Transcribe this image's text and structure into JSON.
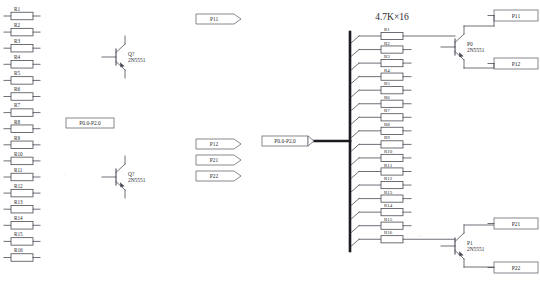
{
  "diagram": {
    "title_label": "4.7K×16",
    "colors": {
      "wire": "#4a4a55",
      "bus": "#1a1a20",
      "text": "#2a2a30",
      "box_fill": "#ffffff",
      "box_stroke": "#6a6a75"
    }
  },
  "left_resistors": [
    {
      "ref": "R1"
    },
    {
      "ref": "R2"
    },
    {
      "ref": "R3"
    },
    {
      "ref": "R4"
    },
    {
      "ref": "R5"
    },
    {
      "ref": "R6"
    },
    {
      "ref": "R7"
    },
    {
      "ref": "R8"
    },
    {
      "ref": "R9"
    },
    {
      "ref": "R10"
    },
    {
      "ref": "R11"
    },
    {
      "ref": "R12"
    },
    {
      "ref": "R13"
    },
    {
      "ref": "R14"
    },
    {
      "ref": "R15"
    },
    {
      "ref": "R16"
    }
  ],
  "array_resistors": [
    {
      "ref": "R1"
    },
    {
      "ref": "R2"
    },
    {
      "ref": "R3"
    },
    {
      "ref": "R4"
    },
    {
      "ref": "R5"
    },
    {
      "ref": "R6"
    },
    {
      "ref": "R7"
    },
    {
      "ref": "R8"
    },
    {
      "ref": "R9"
    },
    {
      "ref": "R10"
    },
    {
      "ref": "R11"
    },
    {
      "ref": "R12"
    },
    {
      "ref": "R13"
    },
    {
      "ref": "R14"
    },
    {
      "ref": "R15"
    },
    {
      "ref": "R16"
    }
  ],
  "left_transistors": [
    {
      "ref": "Q?",
      "part": "2N5551"
    },
    {
      "ref": "Q?",
      "part": "2N5551"
    }
  ],
  "right_transistors": [
    {
      "ref": "P0",
      "part": "2N5551"
    },
    {
      "ref": "P1",
      "part": "2N5551"
    }
  ],
  "net_flags": [
    {
      "name": "P0.0-P2.0",
      "shape": "rect"
    },
    {
      "name": "P11",
      "shape": "flag"
    },
    {
      "name": "P12",
      "shape": "flag"
    },
    {
      "name": "P21",
      "shape": "flag"
    },
    {
      "name": "P22",
      "shape": "flag"
    }
  ],
  "bus_label": "P0.0-P2.0",
  "port_boxes": [
    {
      "name": "P11"
    },
    {
      "name": "P12"
    },
    {
      "name": "P21"
    },
    {
      "name": "P22"
    }
  ]
}
